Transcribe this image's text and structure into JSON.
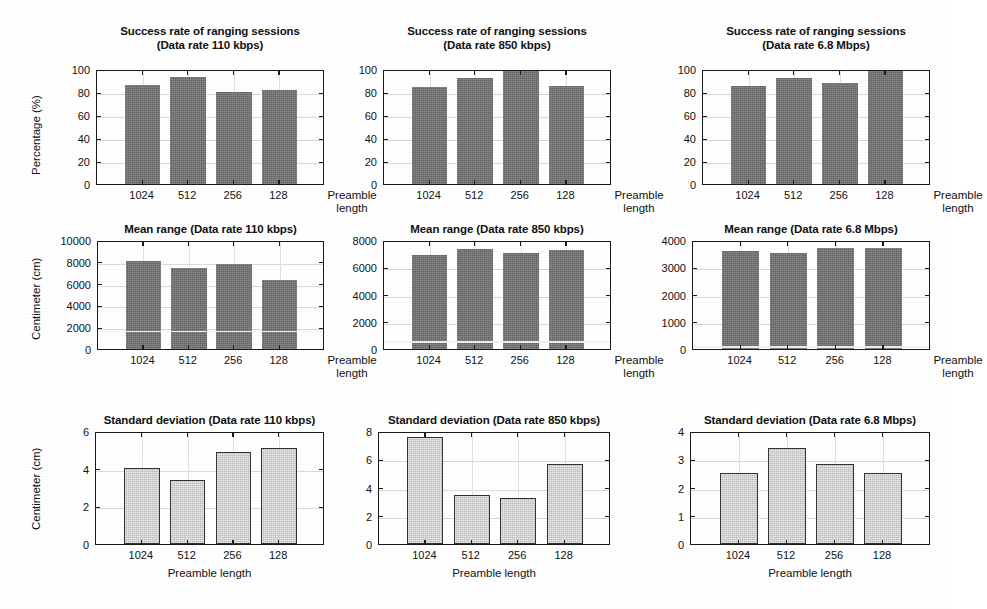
{
  "figure": {
    "background": "#ffffff",
    "bar_color_dark": "#6e6e6e",
    "bar_color_light": "#cccccc",
    "axis_color": "#1a1a1a",
    "grid_color": "#d9d9d9"
  },
  "common": {
    "categories": [
      "1024",
      "512",
      "256",
      "128"
    ],
    "xlabel": "Preamble length",
    "xlabel_line1": "Preamble",
    "xlabel_line2": "length"
  },
  "chart_data": [
    {
      "id": "success-110kbps",
      "type": "bar",
      "title_line1": "Success rate of ranging sessions",
      "title_line2": "(Data rate 110 kbps)",
      "title": "Success rate of ranging sessions (Data rate 110 kbps)",
      "categories": [
        "1024",
        "512",
        "256",
        "128"
      ],
      "values": [
        86,
        93,
        80,
        82
      ],
      "xlabel": "Preamble length",
      "ylabel": "Percentage (%)",
      "ylim": [
        0,
        100
      ],
      "yticks": [
        0,
        20,
        40,
        60,
        80,
        100
      ],
      "grid": true,
      "legend": "none"
    },
    {
      "id": "success-850kbps",
      "type": "bar",
      "title_line1": "Success rate of ranging sessions",
      "title_line2": "(Data rate 850 kbps)",
      "title": "Success rate of ranging sessions (Data rate 850 kbps)",
      "categories": [
        "1024",
        "512",
        "256",
        "128"
      ],
      "values": [
        84,
        92,
        98,
        85
      ],
      "xlabel": "Preamble length",
      "ylabel": "",
      "ylim": [
        0,
        100
      ],
      "yticks": [
        0,
        20,
        40,
        60,
        80,
        100
      ],
      "grid": true,
      "legend": "none"
    },
    {
      "id": "success-68mbps",
      "type": "bar",
      "title_line1": "Success rate of ranging sessions",
      "title_line2": "(Data rate 6.8 Mbps)",
      "title": "Success rate of ranging sessions (Data rate 6.8 Mbps)",
      "categories": [
        "1024",
        "512",
        "256",
        "128"
      ],
      "values": [
        85,
        92,
        88,
        98
      ],
      "xlabel": "Preamble length",
      "ylabel": "",
      "ylim": [
        0,
        100
      ],
      "yticks": [
        0,
        20,
        40,
        60,
        80,
        100
      ],
      "grid": true,
      "legend": "none"
    },
    {
      "id": "meanrange-110kbps",
      "type": "bar",
      "title_line1": "Mean range (Data rate 110 kbps)",
      "title_line2": "",
      "title": "Mean range (Data rate 110 kbps)",
      "categories": [
        "1024",
        "512",
        "256",
        "128"
      ],
      "values": [
        8050,
        7400,
        7800,
        6300
      ],
      "overlay_line": 1850,
      "xlabel": "Preamble length",
      "ylabel": "Centimeter (cm)",
      "ylim": [
        0,
        10000
      ],
      "yticks": [
        0,
        2000,
        4000,
        6000,
        8000,
        10000
      ],
      "grid": true,
      "legend": "none"
    },
    {
      "id": "meanrange-850kbps",
      "type": "bar",
      "title_line1": "Mean range (Data rate 850 kbps)",
      "title_line2": "",
      "title": "Mean range (Data rate 850 kbps)",
      "categories": [
        "1024",
        "512",
        "256",
        "128"
      ],
      "values": [
        6900,
        7350,
        7050,
        7250
      ],
      "overlay_line": 720,
      "xlabel": "Preamble length",
      "ylabel": "",
      "ylim": [
        0,
        8000
      ],
      "yticks": [
        0,
        2000,
        4000,
        6000,
        8000
      ],
      "grid": true,
      "legend": "none"
    },
    {
      "id": "meanrange-68mbps",
      "type": "bar",
      "title_line1": "Mean range (Data rate 6.8 Mbps)",
      "title_line2": "",
      "title": "Mean range (Data rate 6.8 Mbps)",
      "categories": [
        "1024",
        "512",
        "256",
        "128"
      ],
      "values": [
        3600,
        3520,
        3700,
        3700
      ],
      "overlay_line": 170,
      "xlabel": "Preamble length",
      "ylabel": "",
      "ylim": [
        0,
        4000
      ],
      "yticks": [
        0,
        1000,
        2000,
        3000,
        4000
      ],
      "grid": true,
      "legend": "none"
    },
    {
      "id": "stddev-110kbps",
      "type": "bar",
      "title_line1": "Standard deviation (Data rate 110 kbps)",
      "title_line2": "",
      "title": "Standard deviation (Data rate 110 kbps)",
      "categories": [
        "1024",
        "512",
        "256",
        "128"
      ],
      "values": [
        4.05,
        3.4,
        4.9,
        5.1
      ],
      "xlabel": "Preamble length",
      "ylabel": "Centimeter (cm)",
      "ylim": [
        0,
        6
      ],
      "yticks": [
        0,
        2,
        4,
        6
      ],
      "grid": true,
      "legend": "none"
    },
    {
      "id": "stddev-850kbps",
      "type": "bar",
      "title_line1": "Standard deviation (Data rate 850 kbps)",
      "title_line2": "",
      "title": "Standard deviation (Data rate 850 kbps)",
      "categories": [
        "1024",
        "512",
        "256",
        "128"
      ],
      "values": [
        7.6,
        3.45,
        3.25,
        5.65
      ],
      "xlabel": "Preamble length",
      "ylabel": "",
      "ylim": [
        0,
        8
      ],
      "yticks": [
        0,
        2,
        4,
        6,
        8
      ],
      "grid": true,
      "legend": "none"
    },
    {
      "id": "stddev-68mbps",
      "type": "bar",
      "title_line1": "Standard deviation (Data rate 6.8 Mbps)",
      "title_line2": "",
      "title": "Standard deviation (Data rate 6.8 Mbps)",
      "categories": [
        "1024",
        "512",
        "256",
        "128"
      ],
      "values": [
        2.52,
        3.4,
        2.83,
        2.52
      ],
      "xlabel": "Preamble length",
      "ylabel": "",
      "ylim": [
        0,
        4
      ],
      "yticks": [
        0,
        1,
        2,
        3,
        4
      ],
      "grid": true,
      "legend": "none"
    }
  ],
  "layout": {
    "panels": [
      {
        "chart": 0,
        "box": {
          "x": 96,
          "y": 70,
          "w": 228,
          "h": 115
        },
        "title_x": 96,
        "title_y": 24,
        "title_w": 228,
        "title_lines": 2,
        "ylabel_x": 30,
        "ylabel_y": 175,
        "xlabel_mode": "two-line-right",
        "bar_style": "dark"
      },
      {
        "chart": 1,
        "box": {
          "x": 383,
          "y": 70,
          "w": 228,
          "h": 115
        },
        "title_x": 383,
        "title_y": 24,
        "title_w": 228,
        "title_lines": 2,
        "xlabel_mode": "two-line-right",
        "bar_style": "dark"
      },
      {
        "chart": 2,
        "box": {
          "x": 702,
          "y": 70,
          "w": 228,
          "h": 115
        },
        "title_x": 702,
        "title_y": 24,
        "title_w": 228,
        "title_lines": 2,
        "xlabel_mode": "two-line-right",
        "bar_style": "dark"
      },
      {
        "chart": 3,
        "box": {
          "x": 97,
          "y": 241,
          "w": 227,
          "h": 109
        },
        "title_x": 97,
        "title_y": 222,
        "title_w": 227,
        "title_lines": 1,
        "ylabel_x": 30,
        "ylabel_y": 340,
        "xlabel_mode": "two-line-right",
        "bar_style": "dark"
      },
      {
        "chart": 4,
        "box": {
          "x": 383,
          "y": 241,
          "w": 228,
          "h": 109
        },
        "title_x": 383,
        "title_y": 222,
        "title_w": 228,
        "title_lines": 1,
        "xlabel_mode": "two-line-right",
        "bar_style": "dark"
      },
      {
        "chart": 5,
        "box": {
          "x": 692,
          "y": 241,
          "w": 238,
          "h": 109
        },
        "title_x": 692,
        "title_y": 222,
        "title_w": 238,
        "title_lines": 1,
        "xlabel_mode": "two-line-right",
        "bar_style": "dark"
      },
      {
        "chart": 6,
        "box": {
          "x": 95,
          "y": 432,
          "w": 229,
          "h": 113
        },
        "title_x": 95,
        "title_y": 413,
        "title_w": 229,
        "title_lines": 1,
        "ylabel_x": 30,
        "ylabel_y": 530,
        "xlabel_mode": "single",
        "bar_style": "light"
      },
      {
        "chart": 7,
        "box": {
          "x": 378,
          "y": 432,
          "w": 232,
          "h": 113
        },
        "title_x": 378,
        "title_y": 413,
        "title_w": 232,
        "title_lines": 1,
        "xlabel_mode": "single",
        "bar_style": "light"
      },
      {
        "chart": 8,
        "box": {
          "x": 690,
          "y": 432,
          "w": 240,
          "h": 113
        },
        "title_x": 690,
        "title_y": 413,
        "title_w": 240,
        "title_lines": 1,
        "xlabel_mode": "single",
        "bar_style": "light"
      }
    ]
  }
}
